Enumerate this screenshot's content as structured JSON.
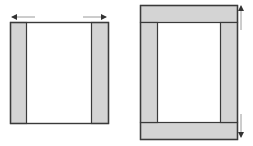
{
  "figures": [
    {
      "name": "horizontal-expansion",
      "frame": {
        "x": 10,
        "y": 22,
        "w": 98,
        "h": 101
      },
      "strips": [
        {
          "side": "left",
          "x": 10,
          "y": 22,
          "w": 16,
          "h": 101
        },
        {
          "side": "right",
          "x": 91,
          "y": 22,
          "w": 17,
          "h": 101
        }
      ],
      "arrows": [
        {
          "direction": "left",
          "x1": 35,
          "y1": 17,
          "x2": 12,
          "y2": 17
        },
        {
          "direction": "right",
          "x1": 83,
          "y1": 17,
          "x2": 106,
          "y2": 17
        }
      ]
    },
    {
      "name": "vertical-expansion",
      "frame": {
        "x": 140,
        "y": 5,
        "w": 97,
        "h": 134
      },
      "strips": [
        {
          "side": "top",
          "x": 140,
          "y": 5,
          "w": 97,
          "h": 17
        },
        {
          "side": "bottom",
          "x": 140,
          "y": 122,
          "w": 97,
          "h": 17
        },
        {
          "side": "left",
          "x": 140,
          "y": 22,
          "w": 17,
          "h": 100
        },
        {
          "side": "right",
          "x": 220,
          "y": 22,
          "w": 17,
          "h": 100
        }
      ],
      "arrows": [
        {
          "direction": "up",
          "x1": 241,
          "y1": 30,
          "x2": 241,
          "y2": 6
        },
        {
          "direction": "down",
          "x1": 241,
          "y1": 114,
          "x2": 241,
          "y2": 137
        }
      ]
    }
  ],
  "colors": {
    "strip_fill": "#d4d4d4",
    "outline": "#3a3a3a",
    "arrow": "#333333",
    "background": "#ffffff"
  }
}
